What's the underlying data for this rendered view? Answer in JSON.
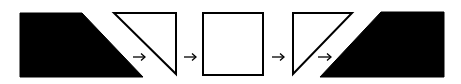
{
  "diagram": {
    "type": "shape-transformation-sequence",
    "stroke_color": "#000000",
    "fill_color": "#000000",
    "background": "#ffffff",
    "shapes": [
      {
        "name": "filled-trapezoid-left",
        "style": "filled",
        "points": "20,13 82,13 143,77 20,77"
      },
      {
        "name": "outline-triangle-right-angle-top-right",
        "style": "outline",
        "points": "114,13 176,13 176,74"
      },
      {
        "name": "outline-square",
        "style": "outline",
        "points": "203,13 263,13 263,75 203,75"
      },
      {
        "name": "outline-triangle-right-angle-top-left",
        "style": "outline",
        "points": "293,13 352,13 293,74"
      },
      {
        "name": "filled-trapezoid-right",
        "style": "filled",
        "points": "381,12 444,12 444,77 320,77"
      }
    ],
    "arrows": [
      {
        "name": "arrow-1",
        "x1": 133,
        "x2": 145,
        "y": 57,
        "glyph": "→"
      },
      {
        "name": "arrow-2",
        "x1": 184,
        "x2": 196,
        "y": 57,
        "glyph": "→"
      },
      {
        "name": "arrow-3",
        "x1": 272,
        "x2": 284,
        "y": 57,
        "glyph": "→"
      },
      {
        "name": "arrow-4",
        "x1": 318,
        "x2": 331,
        "y": 57,
        "glyph": "→"
      }
    ]
  }
}
